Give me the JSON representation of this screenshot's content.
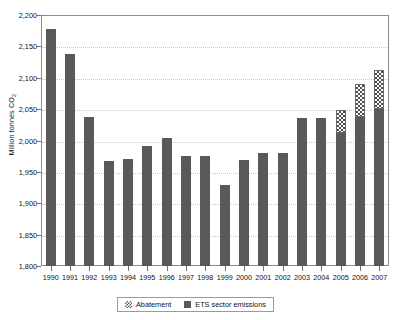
{
  "chart_data": {
    "type": "bar",
    "title": "",
    "subtitle": "",
    "xlabel": "",
    "ylabel": "Million tonnes CO2",
    "ylabel_parts": {
      "main": "Million tonnes CO",
      "sub": "2"
    },
    "ylim": [
      1800,
      2200
    ],
    "ytick_step": 50,
    "ytick_labels": [
      "2,200",
      "2,150",
      "2,100",
      "2,050",
      "2,000",
      "1,950",
      "1,900",
      "1,850",
      "1,800"
    ],
    "ytick_values": [
      2200,
      2150,
      2100,
      2050,
      2000,
      1950,
      1900,
      1850,
      1800
    ],
    "grid": true,
    "grid_style": "dotted-horizontal",
    "legend_position": "bottom-center",
    "stacked": true,
    "categories": [
      "1990",
      "1991",
      "1992",
      "1993",
      "1994",
      "1995",
      "1996",
      "1997",
      "1998",
      "1999",
      "2000",
      "2001",
      "2002",
      "2003",
      "2004",
      "2005",
      "2006",
      "2007"
    ],
    "series": [
      {
        "name": "ETS sector emissions",
        "color": "#595959",
        "pattern": "solid",
        "values": [
          2178,
          2138,
          2037,
          1968,
          1971,
          1991,
          2004,
          1976,
          1976,
          1929,
          1969,
          1980,
          1980,
          2036,
          2036,
          2012,
          2037,
          2050
        ]
      },
      {
        "name": "Abatement",
        "color": "#4d4d4d",
        "pattern": "hatched",
        "values": [
          0,
          0,
          0,
          0,
          0,
          0,
          0,
          0,
          0,
          0,
          0,
          0,
          0,
          0,
          0,
          36,
          53,
          63
        ]
      }
    ],
    "totals": [
      2178,
      2138,
      2037,
      1968,
      1971,
      1991,
      2004,
      1976,
      1976,
      1929,
      1969,
      1980,
      1980,
      2036,
      2036,
      2048,
      2090,
      2113
    ]
  },
  "legend": {
    "items": [
      {
        "label": "Abatement",
        "swatch": "hatched-swatch-icon"
      },
      {
        "label": "ETS sector emissions",
        "swatch": "solid-swatch-icon"
      }
    ]
  },
  "colors": {
    "bar": "#595959",
    "hatch": "#4d4d4d",
    "frame": "#8c8c8c",
    "grid": "#c8c8c8",
    "background": "#ffffff"
  }
}
